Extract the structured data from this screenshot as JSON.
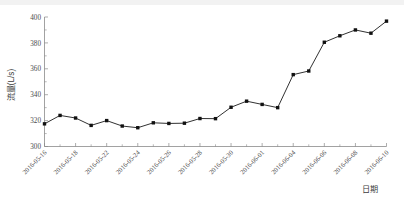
{
  "chart_data": {
    "type": "line",
    "title": "",
    "subtitle": "",
    "xlabel": "日期",
    "ylabel": "流量(L/s)",
    "ylim": [
      300,
      400
    ],
    "y_ticks": [
      300,
      320,
      340,
      360,
      380,
      400
    ],
    "y_minor_step": 10,
    "grid": false,
    "legend": "none",
    "marker": "filled-square",
    "line_color": "#111111",
    "marker_color": "#111111",
    "axis_color": "#8a8a8a",
    "x": [
      "2016-05-16",
      "2016-05-17",
      "2016-05-18",
      "2016-05-21",
      "2016-05-22",
      "2016-05-23",
      "2016-05-24",
      "2016-05-25",
      "2016-05-26",
      "2016-05-27",
      "2016-05-28",
      "2016-05-29",
      "2016-05-30",
      "2016-05-31",
      "2016-06-01",
      "2016-06-03",
      "2016-06-04",
      "2016-06-05",
      "2016-06-06",
      "2016-06-07",
      "2016-06-08",
      "2016-06-09",
      "2016-06-10"
    ],
    "values": [
      317.5,
      324.0,
      322.0,
      316.3,
      320.0,
      315.8,
      314.5,
      318.3,
      317.8,
      318.0,
      321.6,
      321.5,
      330.3,
      335.0,
      332.5,
      330.0,
      355.5,
      358.3,
      380.5,
      385.5,
      390.0,
      387.5,
      396.8
    ],
    "x_tick_labels": [
      "2016-05-16",
      "2016-05-18",
      "2016-05-22",
      "2016-05-24",
      "2016-05-26",
      "2016-05-28",
      "2016-05-30",
      "2016-06-01",
      "2016-06-04",
      "2016-06-06",
      "2016-06-08",
      "2016-06-10"
    ],
    "x_tick_indices": [
      0,
      2,
      4,
      6,
      8,
      10,
      12,
      14,
      16,
      18,
      20,
      22
    ],
    "x_tick_label_rotation": -45,
    "series": [
      {
        "name": "流量",
        "values": [
          317.5,
          324.0,
          322.0,
          316.3,
          320.0,
          315.8,
          314.5,
          318.3,
          317.8,
          318.0,
          321.6,
          321.5,
          330.3,
          335.0,
          332.5,
          330.0,
          355.5,
          358.3,
          380.5,
          385.5,
          390.0,
          387.5,
          396.8
        ]
      }
    ]
  },
  "figure": {
    "y_axis_title": "流量(L/s)",
    "x_axis_title": "日期",
    "caption": ""
  }
}
